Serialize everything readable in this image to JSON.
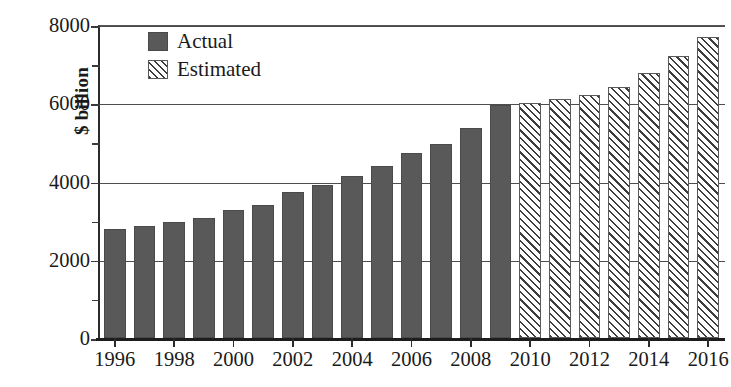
{
  "chart_data": {
    "type": "bar",
    "title": "",
    "xlabel": "",
    "ylabel": "$ billion",
    "ylim": [
      0,
      8000
    ],
    "xlim": [
      1996,
      2016
    ],
    "grid": true,
    "legend_position": "top-left",
    "y_ticks_major": [
      0,
      2000,
      4000,
      6000,
      8000
    ],
    "y_ticks_minor": [
      1000,
      3000,
      5000,
      7000
    ],
    "y_tick_labels": [
      "0",
      "2000",
      "4000",
      "6000",
      "8000"
    ],
    "x_tick_labels": [
      "1996",
      "1998",
      "2000",
      "2002",
      "2004",
      "2006",
      "2008",
      "2010",
      "2012",
      "2014",
      "2016"
    ],
    "categories": [
      "1996",
      "1997",
      "1998",
      "1999",
      "2000",
      "2001",
      "2002",
      "2003",
      "2004",
      "2005",
      "2006",
      "2007",
      "2008",
      "2009",
      "2010",
      "2011",
      "2012",
      "2013",
      "2014",
      "2015",
      "2016"
    ],
    "series": [
      {
        "name": "Actual",
        "color": "#595959",
        "pattern": "solid",
        "values": [
          2780,
          2870,
          2960,
          3060,
          3270,
          3400,
          3720,
          3900,
          4140,
          4400,
          4720,
          4970,
          5370,
          5950,
          null,
          null,
          null,
          null,
          null,
          null,
          null
        ]
      },
      {
        "name": "Estimated",
        "color": "#3d3d3d",
        "pattern": "diagonal-hatch",
        "values": [
          null,
          null,
          null,
          null,
          null,
          null,
          null,
          null,
          null,
          null,
          null,
          null,
          null,
          null,
          6000,
          6100,
          6220,
          6420,
          6780,
          7200,
          7700
        ]
      }
    ]
  },
  "legend": {
    "items": [
      {
        "label": "Actual",
        "pattern": "solid"
      },
      {
        "label": "Estimated",
        "pattern": "diagonal-hatch"
      }
    ]
  },
  "axes": {
    "y_title": "$ billion"
  }
}
